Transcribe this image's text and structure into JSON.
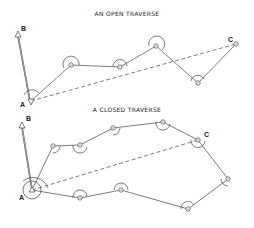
{
  "open_traverse": {
    "title": "AN OPEN TRAVERSE",
    "labels": {
      "A": "A",
      "B": "B",
      "C": "C"
    }
  },
  "closed_traverse": {
    "title": "A CLOSED TRAVERSE",
    "labels": {
      "A": "A",
      "B": "B",
      "C": "C"
    }
  },
  "colors": {
    "line": "#444444",
    "background": "#ffffff"
  }
}
